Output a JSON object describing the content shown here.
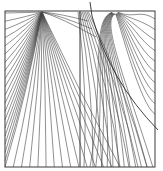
{
  "diagram": {
    "type": "field-line-plot",
    "frame": {
      "x": 5,
      "y": 11,
      "width": 150,
      "height": 156
    },
    "divider_x": 80,
    "colors": {
      "line": "#444444",
      "frame": "#3a3a3a",
      "background": "#ffffff"
    },
    "sources": [
      {
        "name": "left-source",
        "x": 42,
        "y": 12,
        "line_count": 34
      },
      {
        "name": "right-source",
        "x": 115,
        "y": 12,
        "line_count": 22
      }
    ],
    "separatrix": {
      "start": [
        90,
        2
      ],
      "end": [
        158,
        130
      ]
    }
  }
}
